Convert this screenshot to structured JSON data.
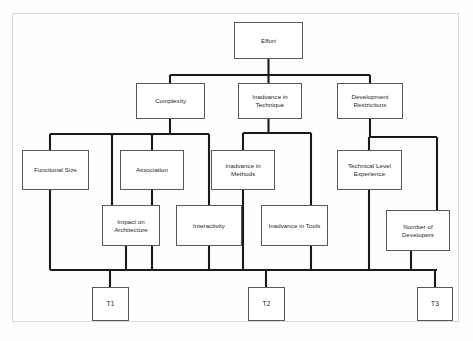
{
  "diagram": {
    "type": "tree-diagram",
    "orientation": "top-down",
    "background_color": "#fdfdfd",
    "frame_color": "#d9d9d9",
    "node_border_color": "#585858",
    "node_fill_color": "#ffffff",
    "connector_color": "#1a1a1a",
    "nodes": [
      {
        "id": "effort",
        "label": "Effort",
        "level": 0,
        "x": 234,
        "y": 22,
        "w": 69,
        "h": 37
      },
      {
        "id": "complexity",
        "label": "Complexity",
        "level": 1,
        "x": 136,
        "y": 83,
        "w": 69,
        "h": 36
      },
      {
        "id": "tech",
        "label": "Inadvance in\nTechnique",
        "level": 1,
        "x": 238,
        "y": 83,
        "w": 64,
        "h": 36
      },
      {
        "id": "devrestr",
        "label": "Development\nRestrictions",
        "level": 1,
        "x": 337,
        "y": 83,
        "w": 66,
        "h": 36
      },
      {
        "id": "funcsize",
        "label": "Functional Size",
        "level": 2,
        "x": 22,
        "y": 150,
        "w": 67,
        "h": 40
      },
      {
        "id": "association",
        "label": "Association",
        "level": 2,
        "x": 120,
        "y": 150,
        "w": 64,
        "h": 40
      },
      {
        "id": "methods",
        "label": "Inadvance in\nMethods",
        "level": 2,
        "x": 211,
        "y": 150,
        "w": 64,
        "h": 40
      },
      {
        "id": "techlevel",
        "label": "Technical Level\nExperience",
        "level": 2,
        "x": 337,
        "y": 150,
        "w": 65,
        "h": 40
      },
      {
        "id": "impactarch",
        "label": "Impact on\nArchitecture",
        "level": 3,
        "x": 102,
        "y": 205,
        "w": 58,
        "h": 41
      },
      {
        "id": "interactivity",
        "label": "Interactivity",
        "level": 3,
        "x": 176,
        "y": 205,
        "w": 66,
        "h": 41
      },
      {
        "id": "tools",
        "label": "Inadvance in Tools",
        "level": 3,
        "x": 261,
        "y": 205,
        "w": 67,
        "h": 41
      },
      {
        "id": "numdev",
        "label": "Number of\nDevelopers",
        "level": 3,
        "x": 386,
        "y": 210,
        "w": 64,
        "h": 41
      },
      {
        "id": "t1",
        "label": "T1",
        "level": 4,
        "x": 92,
        "y": 287,
        "w": 37,
        "h": 34
      },
      {
        "id": "t2",
        "label": "T2",
        "level": 4,
        "x": 248,
        "y": 287,
        "w": 37,
        "h": 34
      },
      {
        "id": "t3",
        "label": "T3",
        "level": 4,
        "x": 417,
        "y": 287,
        "w": 36,
        "h": 34
      }
    ],
    "edges": [
      {
        "from": "effort",
        "to": "complexity"
      },
      {
        "from": "effort",
        "to": "tech"
      },
      {
        "from": "effort",
        "to": "devrestr"
      },
      {
        "from": "complexity",
        "to": "funcsize"
      },
      {
        "from": "complexity",
        "to": "association"
      },
      {
        "from": "complexity",
        "to": "impactarch"
      },
      {
        "from": "complexity",
        "to": "interactivity"
      },
      {
        "from": "tech",
        "to": "methods"
      },
      {
        "from": "tech",
        "to": "tools"
      },
      {
        "from": "devrestr",
        "to": "techlevel"
      },
      {
        "from": "devrestr",
        "to": "numdev"
      },
      {
        "from": "funcsize",
        "to": "t1"
      },
      {
        "from": "association",
        "to": "t1"
      },
      {
        "from": "impactarch",
        "to": "t1"
      },
      {
        "from": "interactivity",
        "to": "t2"
      },
      {
        "from": "methods",
        "to": "t2"
      },
      {
        "from": "tools",
        "to": "t2"
      },
      {
        "from": "techlevel",
        "to": "t3"
      },
      {
        "from": "numdev",
        "to": "t3"
      }
    ]
  }
}
